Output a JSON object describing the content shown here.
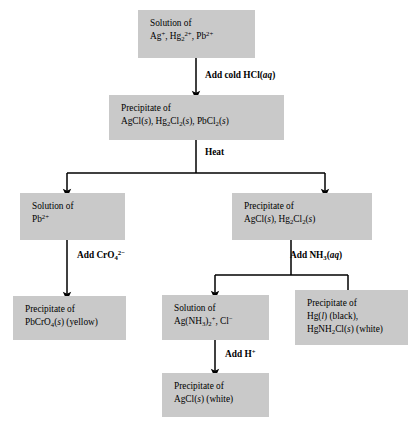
{
  "diagram": {
    "box_fill": "#c9c9c9",
    "line_color": "#000000",
    "background": "#ffffff"
  },
  "boxes": {
    "start_solution": {
      "line1": "Solution of",
      "line2_html": "Ag<sup>+</sup>, Hg<sub>2</sub><sup>2+</sup>, Pb<sup>2+</sup>"
    },
    "chloride_precipitate": {
      "line1": "Precipitate of",
      "line2_html": "AgCl(<i>s</i>), Hg<sub>2</sub>Cl<sub>2</sub>(<i>s</i>), PbCl<sub>2</sub>(<i>s</i>)"
    },
    "lead_solution": {
      "line1": "Solution of",
      "line2_html": "Pb<sup>2+</sup>"
    },
    "silver_mercury_precipitate": {
      "line1": "Precipitate of",
      "line2_html": "AgCl(<i>s</i>), Hg<sub>2</sub>Cl<sub>2</sub>(<i>s</i>)"
    },
    "lead_chromate": {
      "line1": "Precipitate of",
      "line2_html": "PbCrO<sub>4</sub>(<i>s</i>) (yellow)"
    },
    "silver_ammine_solution": {
      "line1": "Solution of",
      "line2_html": "Ag(NH<sub>3</sub>)<sub>2</sub><sup>+</sup>, Cl<sup>&minus;</sup>"
    },
    "mercury_products": {
      "line1": "Precipitate of",
      "line2_html": "Hg(<i>l</i>) (black),",
      "line3_html": "HgNH<sub>2</sub>Cl(<i>s</i>) (white)"
    },
    "silver_chloride_final": {
      "line1": "Precipitate of",
      "line2_html": "AgCl(<i>s</i>) (white)"
    }
  },
  "arrow_labels": {
    "add_cold_hcl": "Add cold HCl(<i>aq</i>)",
    "heat": "Heat",
    "add_chromate": "Add CrO<sub>4</sub><sup>2&minus;</sup>",
    "add_ammonia": "Add NH<sub>3</sub>(<i>aq</i>)",
    "add_acid": "Add H<sup>+</sup>"
  }
}
